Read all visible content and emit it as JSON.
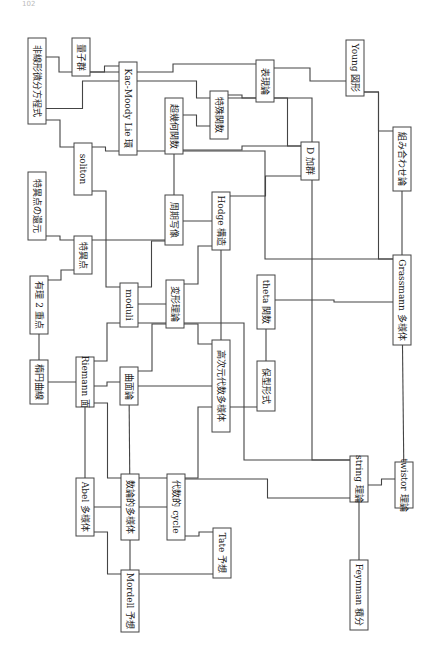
{
  "page_mark": "102",
  "diagram": {
    "orientation": "rotated-90",
    "nodes": [
      {
        "id": "nonlinear_pde",
        "label": "非線形微分方程式"
      },
      {
        "id": "quantum_group",
        "label": "量子群"
      },
      {
        "id": "kac_moody",
        "label": "Kac-Moody Lie 環"
      },
      {
        "id": "soliton",
        "label": "soliton"
      },
      {
        "id": "hypergeometric",
        "label": "超幾何関数"
      },
      {
        "id": "special_functions",
        "label": "特殊関数"
      },
      {
        "id": "representation",
        "label": "表現論"
      },
      {
        "id": "young",
        "label": "Young 図形"
      },
      {
        "id": "d_module",
        "label": "D 加群"
      },
      {
        "id": "combinatorics",
        "label": "組み合わせ論"
      },
      {
        "id": "singular_reduction",
        "label": "特異点の還元"
      },
      {
        "id": "singular_point",
        "label": "特異点"
      },
      {
        "id": "period_map",
        "label": "周期写像"
      },
      {
        "id": "hodge",
        "label": "Hodge 構造"
      },
      {
        "id": "rational_double",
        "label": "有理 2 重点"
      },
      {
        "id": "moduli",
        "label": "moduli"
      },
      {
        "id": "deformation",
        "label": "変形理論"
      },
      {
        "id": "theta",
        "label": "theta 関数"
      },
      {
        "id": "grassmann",
        "label": "Grassmann 多様体"
      },
      {
        "id": "elliptic",
        "label": "楕円曲線"
      },
      {
        "id": "riemann",
        "label": "Riemann 面"
      },
      {
        "id": "surface",
        "label": "曲面論"
      },
      {
        "id": "higher_dim",
        "label": "高次元代数多様体"
      },
      {
        "id": "modular",
        "label": "保型形式"
      },
      {
        "id": "abel",
        "label": "Abel 多様体"
      },
      {
        "id": "arithmetic",
        "label": "数論的多様体"
      },
      {
        "id": "algebraic_cycle",
        "label": "代数的 cycle"
      },
      {
        "id": "string",
        "label": "string 理論"
      },
      {
        "id": "twistor",
        "label": "twistor 理論"
      },
      {
        "id": "mordell",
        "label": "Mordell 予想"
      },
      {
        "id": "tate",
        "label": "Tate 予想"
      },
      {
        "id": "feynman",
        "label": "Feynman 積分"
      }
    ],
    "edges": [
      [
        "nonlinear_pde",
        "quantum_group"
      ],
      [
        "nonlinear_pde",
        "kac_moody"
      ],
      [
        "nonlinear_pde",
        "soliton"
      ],
      [
        "quantum_group",
        "kac_moody"
      ],
      [
        "quantum_group",
        "representation"
      ],
      [
        "kac_moody",
        "representation"
      ],
      [
        "kac_moody",
        "soliton"
      ],
      [
        "kac_moody",
        "grassmann"
      ],
      [
        "hypergeometric",
        "special_functions"
      ],
      [
        "hypergeometric",
        "period_map"
      ],
      [
        "hypergeometric",
        "d_module"
      ],
      [
        "special_functions",
        "representation"
      ],
      [
        "representation",
        "young"
      ],
      [
        "representation",
        "d_module"
      ],
      [
        "representation",
        "string"
      ],
      [
        "young",
        "combinatorics"
      ],
      [
        "young",
        "grassmann"
      ],
      [
        "combinatorics",
        "grassmann"
      ],
      [
        "grassmann",
        "twistor"
      ],
      [
        "grassmann",
        "theta"
      ],
      [
        "soliton",
        "moduli"
      ],
      [
        "singular_reduction",
        "singular_point"
      ],
      [
        "singular_point",
        "rational_double"
      ],
      [
        "singular_point",
        "period_map"
      ],
      [
        "period_map",
        "moduli"
      ],
      [
        "period_map",
        "hodge"
      ],
      [
        "hodge",
        "deformation"
      ],
      [
        "hodge",
        "higher_dim"
      ],
      [
        "hodge",
        "d_module"
      ],
      [
        "moduli",
        "deformation"
      ],
      [
        "moduli",
        "riemann"
      ],
      [
        "moduli",
        "string"
      ],
      [
        "deformation",
        "surface"
      ],
      [
        "deformation",
        "higher_dim"
      ],
      [
        "theta",
        "modular"
      ],
      [
        "rational_double",
        "elliptic"
      ],
      [
        "elliptic",
        "riemann"
      ],
      [
        "riemann",
        "surface"
      ],
      [
        "riemann",
        "abel"
      ],
      [
        "riemann",
        "arithmetic"
      ],
      [
        "surface",
        "higher_dim"
      ],
      [
        "surface",
        "arithmetic"
      ],
      [
        "modular",
        "arithmetic"
      ],
      [
        "abel",
        "arithmetic"
      ],
      [
        "abel",
        "mordell"
      ],
      [
        "arithmetic",
        "algebraic_cycle"
      ],
      [
        "arithmetic",
        "mordell"
      ],
      [
        "algebraic_cycle",
        "string"
      ],
      [
        "mordell",
        "tate"
      ],
      [
        "tate",
        "algebraic_cycle"
      ],
      [
        "string",
        "twistor"
      ],
      [
        "string",
        "feynman"
      ]
    ]
  }
}
